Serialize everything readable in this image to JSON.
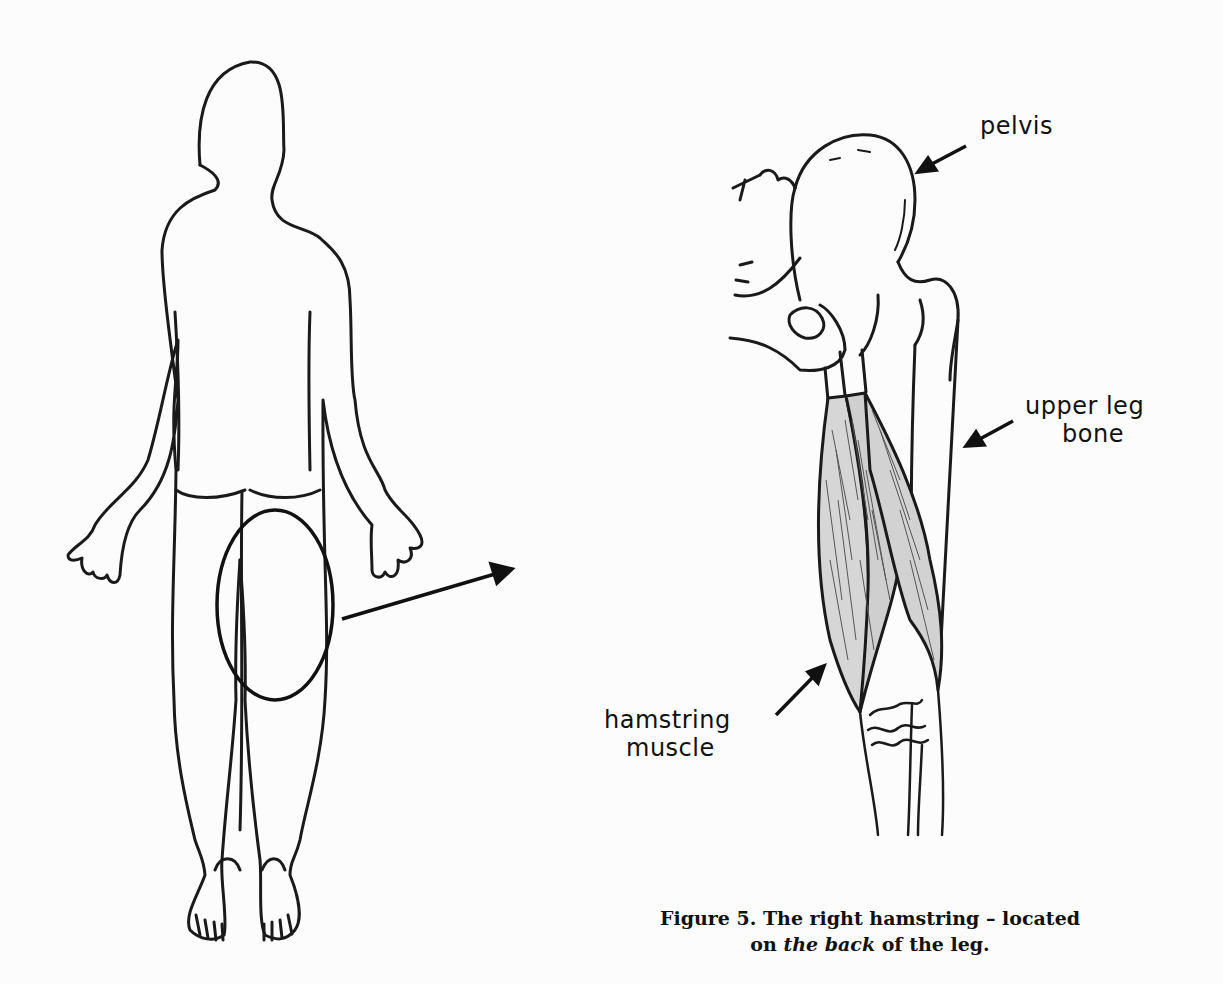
{
  "figure": {
    "number": "Figure 5.",
    "caption_line1": "Figure 5. The right hamstring – located",
    "caption_line2_pre": "on ",
    "caption_line2_emph": "the back",
    "caption_line2_post": " of the leg."
  },
  "labels": {
    "pelvis": "pelvis",
    "upper_leg_bone_line1": "upper leg",
    "upper_leg_bone_line2": "bone",
    "hamstring_line1": "hamstring",
    "hamstring_line2": "muscle"
  },
  "colors": {
    "line": "#1a1a1a",
    "background": "#fcfcfc",
    "muscle_fill": "#d8d8d8"
  }
}
